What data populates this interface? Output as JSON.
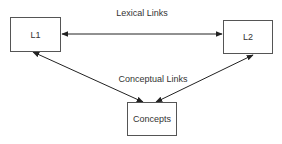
{
  "nodes": {
    "l1": "L1",
    "l2": "L2",
    "concepts": "Concepts"
  },
  "edges": {
    "lexical": {
      "label": "Lexical Links",
      "from": "L1",
      "to": "L2",
      "direction": "bidirectional"
    },
    "conceptual": {
      "label": "Conceptual Links",
      "links": [
        {
          "from": "L1",
          "to": "Concepts",
          "direction": "bidirectional"
        },
        {
          "from": "L2",
          "to": "Concepts",
          "direction": "bidirectional"
        }
      ]
    }
  },
  "colors": {
    "stroke": "#222222",
    "box_border": "#555555",
    "text": "#333333"
  }
}
